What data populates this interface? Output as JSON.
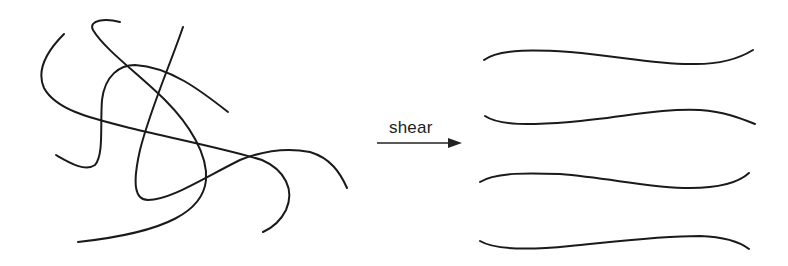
{
  "diagram": {
    "type": "polymer-chain-alignment",
    "left_panel": {
      "description": "entangled random chains",
      "chain_count": 4
    },
    "arrow": {
      "label": "shear",
      "direction": "right"
    },
    "right_panel": {
      "description": "aligned chains",
      "chain_count": 4
    },
    "stroke_color": "#1a1a1a",
    "background_color": "#ffffff"
  }
}
